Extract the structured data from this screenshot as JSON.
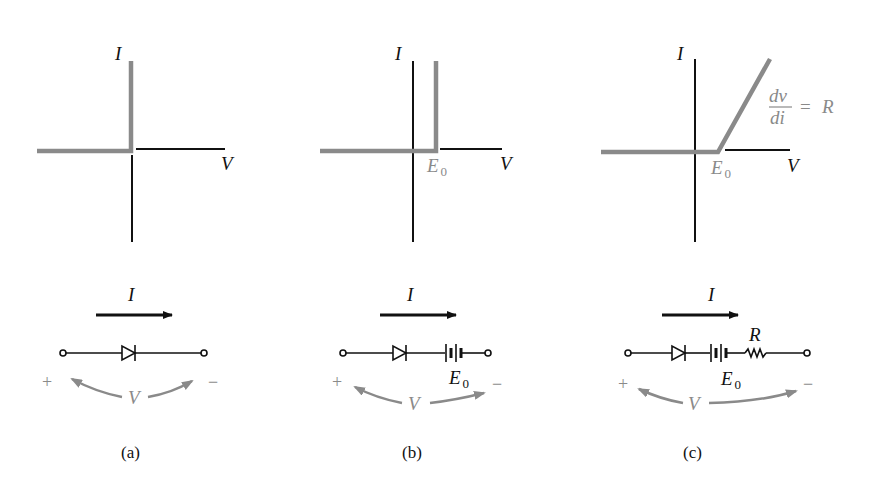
{
  "panels": [
    {
      "id": "a",
      "caption": "(a)",
      "graph": {
        "y_axis_label": "I",
        "x_axis_label": "V",
        "knee_label": "",
        "slope_label": ""
      },
      "circuit": {
        "current_label": "I",
        "voltage_label": "V",
        "plus": "+",
        "minus": "−",
        "components": [
          "diode"
        ],
        "battery_label": "",
        "resistor_label": ""
      },
      "description": "Ideal diode: vertical I–V characteristic at V = 0"
    },
    {
      "id": "b",
      "caption": "(b)",
      "graph": {
        "y_axis_label": "I",
        "x_axis_label": "V",
        "knee_label_main": "E",
        "knee_label_sub": "0",
        "slope_label": ""
      },
      "circuit": {
        "current_label": "I",
        "voltage_label": "V",
        "plus": "+",
        "minus": "−",
        "components": [
          "diode",
          "battery"
        ],
        "battery_label_main": "E",
        "battery_label_sub": "0",
        "resistor_label": ""
      },
      "description": "Ideal diode with offset voltage E0"
    },
    {
      "id": "c",
      "caption": "(c)",
      "graph": {
        "y_axis_label": "I",
        "x_axis_label": "V",
        "knee_label_main": "E",
        "knee_label_sub": "0",
        "slope_num": "dv",
        "slope_den": "di",
        "slope_eq": "=",
        "slope_val": "R"
      },
      "circuit": {
        "current_label": "I",
        "voltage_label": "V",
        "plus": "+",
        "minus": "−",
        "components": [
          "diode",
          "battery",
          "resistor"
        ],
        "battery_label_main": "E",
        "battery_label_sub": "0",
        "resistor_label": "R"
      },
      "description": "Piecewise-linear diode model with offset E0 and resistance R"
    }
  ],
  "colors": {
    "ink": "#111111",
    "characteristic": "#8a8a8a",
    "background": "#ffffff"
  }
}
